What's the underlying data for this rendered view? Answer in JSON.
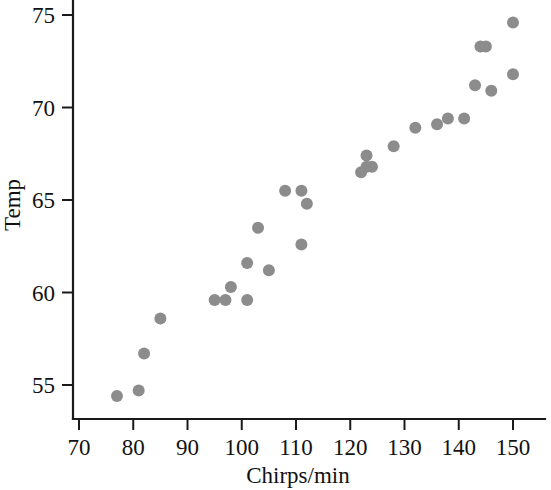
{
  "chart_data": {
    "type": "scatter",
    "title": "",
    "subtitle": "",
    "xlabel": "Chirps/min",
    "ylabel": "Temp",
    "xlim": [
      68,
      153
    ],
    "ylim": [
      52.8,
      75.4
    ],
    "x_ticks": [
      70,
      80,
      90,
      100,
      110,
      120,
      130,
      140,
      150
    ],
    "y_ticks": [
      55,
      60,
      65,
      70,
      75
    ],
    "x_tick_labels": [
      "70",
      "80",
      "90",
      "100",
      "110",
      "120",
      "130",
      "140",
      "150"
    ],
    "y_tick_labels": [
      "55",
      "60",
      "65",
      "70",
      "75"
    ],
    "grid": false,
    "legend": null,
    "legend_position": "none",
    "marker": {
      "shape": "circle",
      "color": "#8c8c8c",
      "radius_px": 6
    },
    "series": [
      {
        "name": "Cricket chirps vs temperature",
        "points": [
          {
            "x": 77,
            "y": 54.4
          },
          {
            "x": 81,
            "y": 54.7
          },
          {
            "x": 82,
            "y": 56.7
          },
          {
            "x": 85,
            "y": 58.6
          },
          {
            "x": 95,
            "y": 59.6
          },
          {
            "x": 97,
            "y": 59.6
          },
          {
            "x": 98,
            "y": 60.3
          },
          {
            "x": 101,
            "y": 59.6
          },
          {
            "x": 101,
            "y": 61.6
          },
          {
            "x": 103,
            "y": 63.5
          },
          {
            "x": 105,
            "y": 61.2
          },
          {
            "x": 108,
            "y": 65.5
          },
          {
            "x": 111,
            "y": 65.5
          },
          {
            "x": 112,
            "y": 64.8
          },
          {
            "x": 111,
            "y": 62.6
          },
          {
            "x": 122,
            "y": 66.5
          },
          {
            "x": 123,
            "y": 67.4
          },
          {
            "x": 123,
            "y": 66.8
          },
          {
            "x": 124,
            "y": 66.8
          },
          {
            "x": 128,
            "y": 67.9
          },
          {
            "x": 132,
            "y": 68.9
          },
          {
            "x": 136,
            "y": 69.1
          },
          {
            "x": 138,
            "y": 69.4
          },
          {
            "x": 141,
            "y": 69.4
          },
          {
            "x": 143,
            "y": 71.2
          },
          {
            "x": 144,
            "y": 73.3
          },
          {
            "x": 145,
            "y": 73.3
          },
          {
            "x": 146,
            "y": 70.9
          },
          {
            "x": 150,
            "y": 71.8
          },
          {
            "x": 150,
            "y": 74.6
          }
        ]
      }
    ]
  }
}
